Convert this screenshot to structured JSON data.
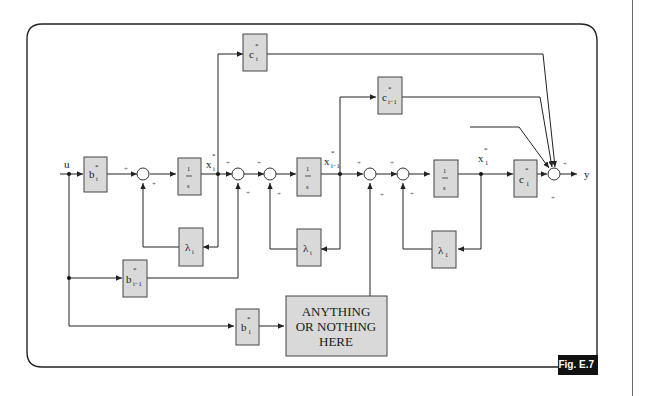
{
  "figure": {
    "tag": "Fig. E.7",
    "frame": {
      "stroke": "#222222",
      "radius": 16
    }
  },
  "signals": {
    "input": "u",
    "output": "y",
    "states": [
      {
        "id": "xi",
        "base": "x",
        "sub": "i",
        "sup": "*"
      },
      {
        "id": "xi1",
        "base": "x",
        "sub": "i−1",
        "sup": "*"
      },
      {
        "id": "x1",
        "base": "x",
        "sub": "1",
        "sup": "*"
      }
    ]
  },
  "blocks": {
    "b_i": {
      "base": "b",
      "sub": "i",
      "sup": "*"
    },
    "b_i1": {
      "base": "b",
      "sub": "i−1",
      "sup": "*"
    },
    "b_1": {
      "base": "b",
      "sub": "1",
      "sup": "*"
    },
    "c_i": {
      "base": "c",
      "sub": "i",
      "sup": "*"
    },
    "c_i1": {
      "base": "c",
      "sub": "i−1",
      "sup": "*"
    },
    "c_1": {
      "base": "c",
      "sub": "1",
      "sup": "*"
    },
    "integrator": {
      "num": "1",
      "den": "s"
    },
    "lambda": {
      "base": "λ",
      "sub": "i"
    },
    "lambda_1": {
      "base": "λ",
      "sub": "1"
    },
    "placeholder": {
      "lines": [
        "ANYTHING",
        "OR NOTHING",
        "HERE"
      ]
    }
  },
  "signs": {
    "plus": "+"
  },
  "colors": {
    "block_fill": "#d9d9d9",
    "block_stroke": "#444444",
    "tag_bg": "#111111",
    "tag_fg": "#ffffff"
  }
}
